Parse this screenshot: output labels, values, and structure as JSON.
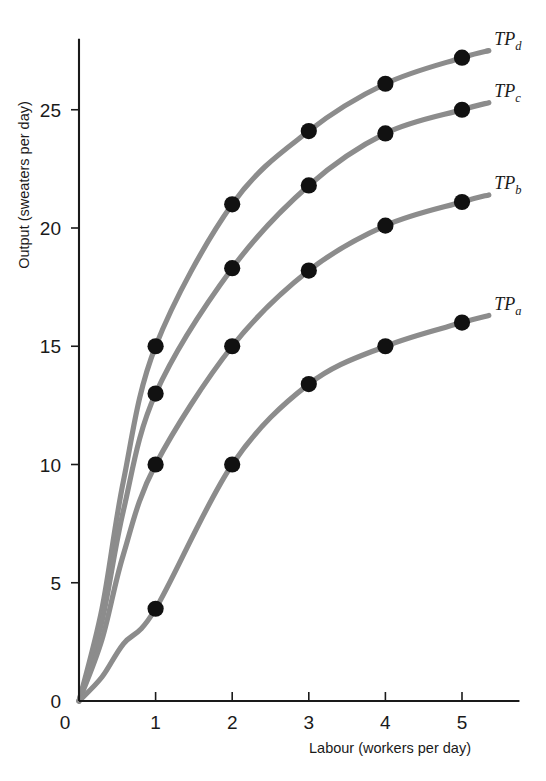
{
  "chart_data": {
    "type": "line",
    "title": "",
    "subtitle": "",
    "xlabel": "Labour (workers per day)",
    "ylabel": "Output (sweaters per day)",
    "xlim": [
      0,
      5.75
    ],
    "ylim": [
      0,
      28
    ],
    "xticks": [
      0,
      1,
      2,
      3,
      4,
      5
    ],
    "xticklabels": [
      "0",
      "1",
      "2",
      "3",
      "4",
      "5"
    ],
    "yticks": [
      0,
      5,
      10,
      15,
      20,
      25
    ],
    "yticklabels": [
      "0",
      "5",
      "10",
      "15",
      "20",
      "25"
    ],
    "grid": false,
    "legend_position": "right-end-of-curve",
    "x": [
      0,
      1,
      2,
      3,
      4,
      5
    ],
    "series": [
      {
        "name": "TPd",
        "label_main": "TP",
        "label_sub": "d",
        "values": [
          0,
          15.0,
          21.0,
          24.1,
          26.1,
          27.2
        ],
        "color": "#8c8c8c",
        "marker": "filled-circle",
        "markers_at_x": [
          1,
          2,
          3,
          4,
          5
        ]
      },
      {
        "name": "TPc",
        "label_main": "TP",
        "label_sub": "c",
        "values": [
          0,
          13.0,
          18.3,
          21.8,
          24.0,
          25.0
        ],
        "color": "#8c8c8c",
        "marker": "filled-circle",
        "markers_at_x": [
          1,
          2,
          3,
          4,
          5
        ]
      },
      {
        "name": "TPb",
        "label_main": "TP",
        "label_sub": "b",
        "values": [
          0,
          10.0,
          15.0,
          18.2,
          20.1,
          21.1
        ],
        "color": "#8c8c8c",
        "marker": "filled-circle",
        "markers_at_x": [
          1,
          2,
          3,
          4,
          5
        ]
      },
      {
        "name": "TPa",
        "label_main": "TP",
        "label_sub": "a",
        "values": [
          0,
          3.9,
          10.0,
          13.4,
          15.0,
          16.0
        ],
        "color": "#8c8c8c",
        "marker": "filled-circle",
        "markers_at_x": [
          1,
          2,
          3,
          4,
          5
        ]
      }
    ],
    "colors": {
      "curve": "#8c8c8c",
      "marker": "#111111",
      "axis": "#1a1a1a",
      "background": "#ffffff"
    }
  }
}
